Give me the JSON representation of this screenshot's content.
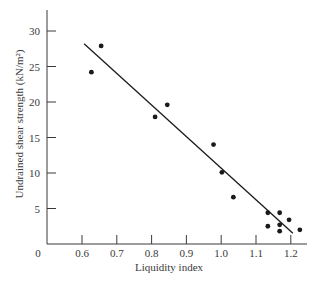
{
  "chart_data": {
    "type": "scatter",
    "title": "",
    "xlabel": "Liquidity index",
    "ylabel": "Undrained shear strength (kN/m²)",
    "xlim": [
      0.5,
      1.25
    ],
    "ylim": [
      0,
      33
    ],
    "x_ticks": [
      0.6,
      0.7,
      0.8,
      0.9,
      1.0,
      1.1,
      1.2
    ],
    "x_tick_labels": [
      "0.6",
      "0.7",
      "0.8",
      "0.9",
      "1.0",
      "1.1",
      "1.2"
    ],
    "y_ticks": [
      5,
      10,
      15,
      20,
      25,
      30
    ],
    "y_tick_labels": [
      "5",
      "10",
      "15",
      "20",
      "25",
      "30"
    ],
    "origin_label": "0",
    "grid": false,
    "legend": null,
    "series": [
      {
        "name": "Measured",
        "marker": "filled-circle",
        "points": [
          {
            "x": 0.627,
            "y": 24.2
          },
          {
            "x": 0.655,
            "y": 27.9
          },
          {
            "x": 0.81,
            "y": 17.9
          },
          {
            "x": 0.845,
            "y": 19.6
          },
          {
            "x": 0.978,
            "y": 14.0
          },
          {
            "x": 1.002,
            "y": 10.1
          },
          {
            "x": 1.035,
            "y": 6.6
          },
          {
            "x": 1.134,
            "y": 4.4
          },
          {
            "x": 1.168,
            "y": 4.4
          },
          {
            "x": 1.195,
            "y": 3.4
          },
          {
            "x": 1.134,
            "y": 2.5
          },
          {
            "x": 1.168,
            "y": 2.7
          },
          {
            "x": 1.168,
            "y": 1.8
          },
          {
            "x": 1.226,
            "y": 2.0
          }
        ]
      },
      {
        "name": "Best-fit line",
        "type": "line",
        "points": [
          {
            "x": 0.606,
            "y": 28.2
          },
          {
            "x": 1.206,
            "y": 1.5
          }
        ]
      }
    ]
  },
  "colors": {
    "axis": "#3a3a3a",
    "marker": "#1a1a1a",
    "line": "#1a1a1a",
    "text": "#3a3a3a"
  }
}
